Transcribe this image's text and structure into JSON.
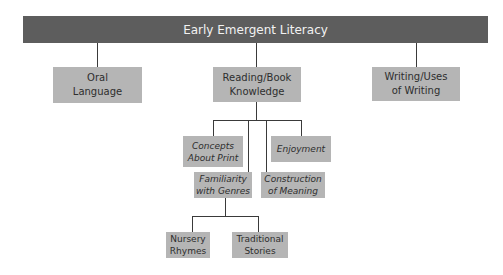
{
  "diagram": {
    "title": "Early Emergent Literacy",
    "level2": [
      {
        "label": "Oral\nLanguage"
      },
      {
        "label": "Reading/Book\nKnowledge"
      },
      {
        "label": "Writing/Uses\nof Writing"
      }
    ],
    "reading_children": [
      {
        "label": "Concepts\nAbout Print"
      },
      {
        "label": "Enjoyment"
      },
      {
        "label": "Familiarity\nwith Genres"
      },
      {
        "label": "Construction\nof Meaning"
      }
    ],
    "genre_children": [
      {
        "label": "Nursery\nRhymes"
      },
      {
        "label": "Traditional\nStories"
      }
    ],
    "colors": {
      "header_fill": "#5d5d5d",
      "node_fill": "#b5b5b5",
      "line": "#3a3a3a"
    }
  }
}
